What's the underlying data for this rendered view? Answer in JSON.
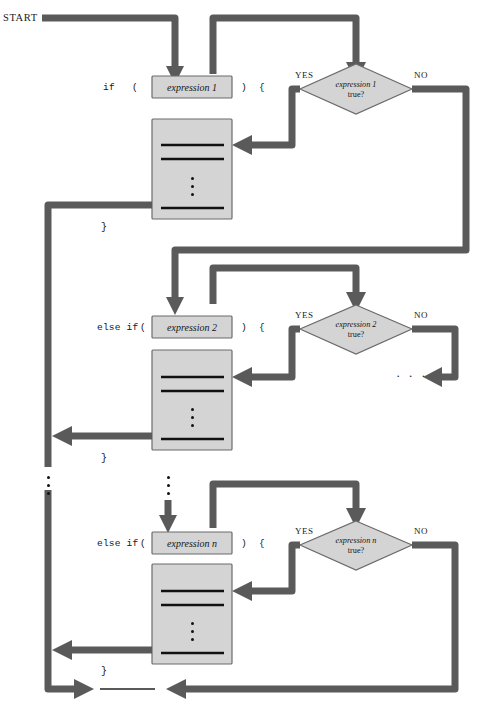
{
  "diagram": {
    "start_label": "START",
    "colors": {
      "arrow": "#5a5a5a",
      "shape_fill": "#d4d4d4",
      "shape_stroke": "#6b6b6b",
      "text": "#141414",
      "background": "#ffffff"
    },
    "branches": [
      {
        "keyword": "if",
        "open_paren": "(",
        "expression": "expression 1",
        "close_paren": ")",
        "open_brace": "{",
        "close_brace": "}",
        "condition_expr": "expression 1",
        "condition_suffix": "true?",
        "yes_label": "YES",
        "no_label": "NO"
      },
      {
        "keyword": "else if",
        "open_paren": "(",
        "expression": "expression 2",
        "close_paren": ")",
        "open_brace": "{",
        "close_brace": "}",
        "condition_expr": "expression 2",
        "condition_suffix": "true?",
        "yes_label": "YES",
        "no_label": "NO"
      },
      {
        "keyword": "else if",
        "open_paren": "(",
        "expression": "expression n",
        "close_paren": ")",
        "open_brace": "{",
        "close_brace": "}",
        "condition_expr": "expression n",
        "condition_suffix": "true?",
        "yes_label": "YES",
        "no_label": "NO"
      }
    ],
    "ellipsis": {
      "horizontal": "· · ·",
      "vertical_marker": "vertical-ellipsis"
    },
    "statement_block": {
      "name": "statements",
      "line_count": 3,
      "has_vertical_ellipsis": true
    },
    "next_statement_label": ""
  }
}
